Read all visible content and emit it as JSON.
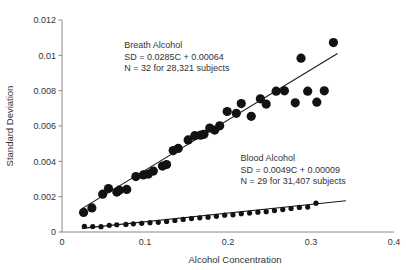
{
  "chart_data": {
    "type": "scatter",
    "title": "",
    "xlabel": "Alcohol Concentration",
    "ylabel": "Standard Deviation",
    "xlim": [
      0,
      0.4
    ],
    "ylim": [
      0,
      0.012
    ],
    "xticks": [
      "0",
      "0.1",
      "0.2",
      "0.3",
      "0.4"
    ],
    "xtick_values": [
      0,
      0.1,
      0.2,
      0.3,
      0.4
    ],
    "yticks": [
      "0",
      "0.002",
      "0.004",
      "0.006",
      "0.008",
      "0.01",
      "0.012"
    ],
    "ytick_values": [
      0,
      0.002,
      0.004,
      0.006,
      0.008,
      0.01,
      0.012
    ],
    "grid": false,
    "legend_position": "none",
    "series": [
      {
        "name": "Breath Alcohol",
        "marker": "circle",
        "marker_size": 4.6,
        "color": "#121212",
        "fit_label": "SD = 0.0285C + 0.00064",
        "fit_slope": 0.0285,
        "fit_intercept": 0.00064,
        "n_label": "N = 32 for 28,321 subjects",
        "n_points": 32,
        "n_subjects": 28321,
        "fit_x_range": [
          0.024,
          0.332
        ],
        "points": [
          {
            "x": 0.026,
            "y": 0.00111
          },
          {
            "x": 0.036,
            "y": 0.00136
          },
          {
            "x": 0.049,
            "y": 0.00214
          },
          {
            "x": 0.056,
            "y": 0.00246
          },
          {
            "x": 0.066,
            "y": 0.00226
          },
          {
            "x": 0.069,
            "y": 0.00237
          },
          {
            "x": 0.078,
            "y": 0.00241
          },
          {
            "x": 0.089,
            "y": 0.00314
          },
          {
            "x": 0.098,
            "y": 0.00323
          },
          {
            "x": 0.104,
            "y": 0.00328
          },
          {
            "x": 0.11,
            "y": 0.00345
          },
          {
            "x": 0.121,
            "y": 0.00373
          },
          {
            "x": 0.126,
            "y": 0.00382
          },
          {
            "x": 0.134,
            "y": 0.00461
          },
          {
            "x": 0.14,
            "y": 0.00473
          },
          {
            "x": 0.152,
            "y": 0.00521
          },
          {
            "x": 0.16,
            "y": 0.00545
          },
          {
            "x": 0.167,
            "y": 0.00548
          },
          {
            "x": 0.171,
            "y": 0.00553
          },
          {
            "x": 0.178,
            "y": 0.00588
          },
          {
            "x": 0.184,
            "y": 0.00577
          },
          {
            "x": 0.19,
            "y": 0.00601
          },
          {
            "x": 0.199,
            "y": 0.00682
          },
          {
            "x": 0.21,
            "y": 0.00672
          },
          {
            "x": 0.216,
            "y": 0.00727
          },
          {
            "x": 0.228,
            "y": 0.00655
          },
          {
            "x": 0.239,
            "y": 0.00754
          },
          {
            "x": 0.246,
            "y": 0.00724
          },
          {
            "x": 0.258,
            "y": 0.00797
          },
          {
            "x": 0.268,
            "y": 0.00799
          },
          {
            "x": 0.281,
            "y": 0.00731
          },
          {
            "x": 0.288,
            "y": 0.00984
          },
          {
            "x": 0.296,
            "y": 0.00797
          },
          {
            "x": 0.307,
            "y": 0.00735
          },
          {
            "x": 0.316,
            "y": 0.00799
          },
          {
            "x": 0.327,
            "y": 0.01072
          }
        ]
      },
      {
        "name": "Blood Alcohol",
        "marker": "circle",
        "marker_size": 2.6,
        "color": "#121212",
        "fit_label": "SD = 0.0049C + 0.00009",
        "fit_slope": 0.0049,
        "fit_intercept": 9e-05,
        "n_label": "N = 29 for 31,407 subjects",
        "n_points": 29,
        "n_subjects": 31407,
        "fit_x_range": [
          0.024,
          0.342
        ],
        "points": [
          {
            "x": 0.027,
            "y": 0.00032
          },
          {
            "x": 0.037,
            "y": 0.00031
          },
          {
            "x": 0.047,
            "y": 0.0003
          },
          {
            "x": 0.057,
            "y": 0.00038
          },
          {
            "x": 0.066,
            "y": 0.00041
          },
          {
            "x": 0.077,
            "y": 0.00043
          },
          {
            "x": 0.086,
            "y": 0.00046
          },
          {
            "x": 0.096,
            "y": 0.00049
          },
          {
            "x": 0.106,
            "y": 0.00053
          },
          {
            "x": 0.116,
            "y": 0.00055
          },
          {
            "x": 0.126,
            "y": 0.0006
          },
          {
            "x": 0.136,
            "y": 0.00065
          },
          {
            "x": 0.146,
            "y": 0.00071
          },
          {
            "x": 0.156,
            "y": 0.00076
          },
          {
            "x": 0.166,
            "y": 0.0008
          },
          {
            "x": 0.176,
            "y": 0.00084
          },
          {
            "x": 0.186,
            "y": 0.00089
          },
          {
            "x": 0.196,
            "y": 0.00095
          },
          {
            "x": 0.206,
            "y": 0.00097
          },
          {
            "x": 0.216,
            "y": 0.00104
          },
          {
            "x": 0.226,
            "y": 0.00107
          },
          {
            "x": 0.236,
            "y": 0.00112
          },
          {
            "x": 0.246,
            "y": 0.00115
          },
          {
            "x": 0.256,
            "y": 0.00121
          },
          {
            "x": 0.266,
            "y": 0.00127
          },
          {
            "x": 0.276,
            "y": 0.00133
          },
          {
            "x": 0.286,
            "y": 0.00139
          },
          {
            "x": 0.296,
            "y": 0.00141
          },
          {
            "x": 0.306,
            "y": 0.00163
          }
        ]
      }
    ],
    "annotations": [
      {
        "id": "breath",
        "lines": [
          "Breath Alcohol",
          "SD = 0.0285C + 0.00064",
          "N = 32 for 28,321 subjects"
        ],
        "x": 0.075,
        "y": 0.0104
      },
      {
        "id": "blood",
        "lines": [
          "Blood Alcohol",
          "SD = 0.0049C + 0.00009",
          "N = 29 for 31,407 subjects"
        ],
        "x": 0.215,
        "y": 0.004
      }
    ]
  }
}
